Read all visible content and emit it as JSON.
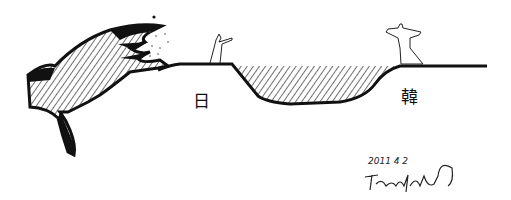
{
  "drawing": {
    "labels": {
      "japan": "日",
      "korea": "韓"
    },
    "date": "2011 4 2",
    "signature": "signature",
    "colors": {
      "ink": "#111111",
      "paper": "#ffffff"
    }
  }
}
